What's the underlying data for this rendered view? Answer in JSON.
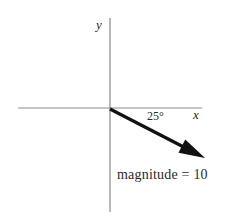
{
  "figure": {
    "title": "",
    "background_color": "#ffffff",
    "axis_color": "#8a8a8a",
    "vector_color": "#111111",
    "text_color": "#2a2a2a"
  },
  "axes": {
    "y_label": "y",
    "x_label": "x",
    "origin": {
      "x": 110,
      "y": 108
    },
    "x_axis": {
      "x_start": 18,
      "x_end": 202,
      "y": 108
    },
    "y_axis": {
      "x": 110,
      "y_start": 18,
      "y_end": 212
    }
  },
  "annotations": {
    "angle_label": "25°",
    "magnitude_label": "magnitude = 10"
  },
  "chart_data": {
    "type": "scatter",
    "title": "",
    "xlabel": "x",
    "ylabel": "y",
    "grid": false,
    "legend": null,
    "vectors": [
      {
        "name": "vector",
        "magnitude": 10,
        "angle_degrees": -25,
        "angle_label": "25°",
        "direction": "below positive x-axis",
        "origin": [
          0,
          0
        ],
        "tip_pixel": [
          205,
          158
        ],
        "components": {
          "x": 9.06,
          "y": -4.23
        },
        "arrowhead": true,
        "label": "magnitude = 10"
      }
    ]
  }
}
